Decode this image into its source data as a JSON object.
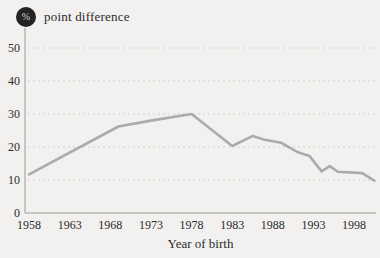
{
  "chart_data": {
    "type": "line",
    "title": "point difference",
    "unit_badge": "%",
    "xlabel": "Year of birth",
    "x_ticks": [
      1958,
      1963,
      1968,
      1973,
      1978,
      1983,
      1988,
      1993,
      1998
    ],
    "y_ticks": [
      0,
      10,
      20,
      30,
      40,
      50
    ],
    "xlim": [
      1957.5,
      2000.7
    ],
    "ylim": [
      0,
      55
    ],
    "grid": "horizontal-dashed",
    "legend": "none",
    "series": [
      {
        "name": "point difference",
        "x": [
          1958,
          1969,
          1973,
          1978,
          1983,
          1985.5,
          1987,
          1989,
          1991,
          1992.5,
          1994,
          1995,
          1996,
          1999,
          2000.5
        ],
        "y": [
          11.7,
          26.2,
          28,
          30,
          20.3,
          23.3,
          22.2,
          21.3,
          18.5,
          17.3,
          12.6,
          14.2,
          12.5,
          12.1,
          9.8
        ]
      }
    ],
    "colors": {
      "background": "#f2f1ef",
      "line": "#ababab",
      "grid": "#d2d1ce",
      "axis": "#9d9c99",
      "text": "#2b2b2b",
      "badge_bg": "#242424",
      "badge_text": "#d6d5d2"
    }
  }
}
